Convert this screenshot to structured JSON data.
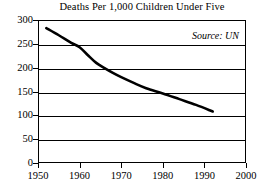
{
  "chart_data": {
    "type": "line",
    "title": "Deaths Per 1,000 Children Under Five",
    "xlabel": "",
    "ylabel": "",
    "annotation": "Source: UN",
    "grid": true,
    "legend": "none",
    "xlim": [
      1950,
      2000
    ],
    "ylim": [
      0,
      300
    ],
    "x_ticks": [
      1950,
      1960,
      1970,
      1980,
      1990,
      2000
    ],
    "y_ticks": [
      0,
      50,
      100,
      150,
      200,
      250,
      300
    ],
    "x": [
      1952,
      1955,
      1958,
      1960,
      1962,
      1964,
      1966,
      1968,
      1970,
      1973,
      1976,
      1980,
      1984,
      1988,
      1992
    ],
    "values": [
      283,
      268,
      252,
      243,
      226,
      210,
      199,
      189,
      180,
      168,
      157,
      146,
      134,
      122,
      108
    ],
    "series": [
      {
        "name": "Deaths per 1,000 children under five",
        "values": [
          283,
          268,
          252,
          243,
          226,
          210,
          199,
          189,
          180,
          168,
          157,
          146,
          134,
          122,
          108
        ]
      }
    ]
  },
  "axes": {
    "y_tick_labels": [
      "300",
      "250",
      "200",
      "150",
      "100",
      "50",
      "0"
    ],
    "x_tick_labels": [
      "1950",
      "1960",
      "1970",
      "1980",
      "1990",
      "2000"
    ]
  },
  "colors": {
    "line": "#000000",
    "grid": "#000000",
    "frame": "#000000",
    "background": "#ffffff"
  }
}
